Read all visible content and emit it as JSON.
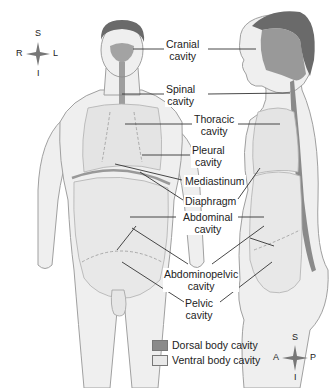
{
  "diagram": {
    "colors": {
      "dorsal": "#8a8a8a",
      "ventral": "#e6e6e6",
      "skin": "#efefef",
      "outline": "#9a9a9a",
      "hair": "#6a6a6a"
    },
    "labels": {
      "cranial": [
        "Cranial",
        "cavity"
      ],
      "spinal": [
        "Spinal",
        "cavity"
      ],
      "thoracic": [
        "Thoracic",
        "cavity"
      ],
      "pleural": [
        "Pleural",
        "cavity"
      ],
      "mediastinum": "Mediastinum",
      "diaphragm": "Diaphragm",
      "abdominal": [
        "Abdominal",
        "cavity"
      ],
      "abdominopelvic": [
        "Abdominopelvic",
        "cavity"
      ],
      "pelvic": [
        "Pelvic",
        "cavity"
      ]
    },
    "legend": [
      {
        "label": "Dorsal body cavity",
        "color": "#8a8a8a"
      },
      {
        "label": "Ventral body cavity",
        "color": "#e8e8e8"
      }
    ],
    "compass_front": {
      "top": "S",
      "bottom": "I",
      "left": "R",
      "right": "L"
    },
    "compass_side": {
      "top": "S",
      "bottom": "I",
      "left": "A",
      "right": "P"
    }
  }
}
